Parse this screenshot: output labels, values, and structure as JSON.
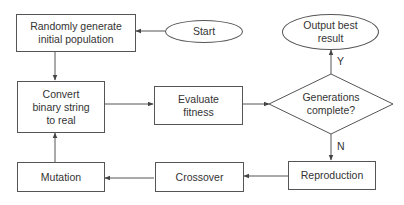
{
  "diagram": {
    "type": "flowchart",
    "title": "",
    "nodes": {
      "start": {
        "label": "Start",
        "shape": "ellipse"
      },
      "random_init": {
        "label": "Randomly generate initial population",
        "line1": "Randomly generate",
        "line2": "initial population",
        "shape": "rectangle"
      },
      "convert": {
        "label": "Convert binary string to real",
        "line1": "Convert",
        "line2": "binary string",
        "line3": "to real",
        "shape": "rectangle"
      },
      "evaluate": {
        "label": "Evaluate fitness",
        "line1": "Evaluate",
        "line2": "fitness",
        "shape": "rectangle"
      },
      "decision": {
        "label": "Generations complete?",
        "line1": "Generations",
        "line2": "complete?",
        "shape": "diamond"
      },
      "output": {
        "label": "Output best result",
        "line1": "Output best",
        "line2": "result",
        "shape": "ellipse"
      },
      "reproduction": {
        "label": "Reproduction",
        "shape": "rectangle"
      },
      "crossover": {
        "label": "Crossover",
        "shape": "rectangle"
      },
      "mutation": {
        "label": "Mutation",
        "shape": "rectangle"
      }
    },
    "edges": [
      {
        "from": "start",
        "to": "random_init",
        "label": ""
      },
      {
        "from": "random_init",
        "to": "convert",
        "label": ""
      },
      {
        "from": "convert",
        "to": "evaluate",
        "label": ""
      },
      {
        "from": "evaluate",
        "to": "decision",
        "label": ""
      },
      {
        "from": "decision",
        "to": "output",
        "label": "Y"
      },
      {
        "from": "decision",
        "to": "reproduction",
        "label": "N"
      },
      {
        "from": "reproduction",
        "to": "crossover",
        "label": ""
      },
      {
        "from": "crossover",
        "to": "mutation",
        "label": ""
      },
      {
        "from": "mutation",
        "to": "convert",
        "label": ""
      }
    ],
    "edge_labels": {
      "yes": "Y",
      "no": "N"
    },
    "colors": {
      "stroke": "#555555",
      "text": "#333333",
      "background": "#ffffff"
    }
  }
}
